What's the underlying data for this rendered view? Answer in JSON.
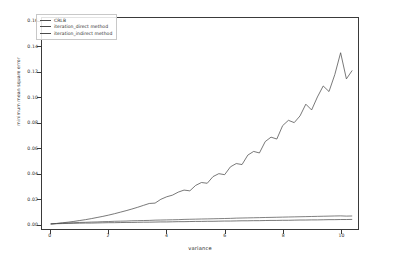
{
  "chart_data": {
    "type": "line",
    "title": "",
    "xlabel": "variance",
    "ylabel": "minimum mean square error",
    "xlim": [
      -0.3,
      10.6
    ],
    "ylim": [
      -0.004,
      0.163
    ],
    "grid": false,
    "legend_position": "upper left",
    "xticks": [
      "0",
      "2",
      "4",
      "6",
      "8",
      "10"
    ],
    "xtick_values": [
      0,
      2,
      4,
      6,
      8,
      10
    ],
    "yticks": [
      "0.00",
      "0.02",
      "0.04",
      "0.06",
      "0.08",
      "0.10",
      "0.12",
      "0.14",
      "0.16"
    ],
    "ytick_values": [
      0.0,
      0.02,
      0.04,
      0.06,
      0.08,
      0.1,
      0.12,
      0.14,
      0.16
    ],
    "series": [
      {
        "name": "CRLB",
        "color": "#4a4a4a",
        "x": [
          0.0,
          0.2,
          0.4,
          0.6,
          0.8,
          1.0,
          1.2,
          1.4,
          1.6,
          1.8,
          2.0,
          2.2,
          2.4,
          2.6,
          2.8,
          3.0,
          3.2,
          3.4,
          3.6,
          3.8,
          4.0,
          4.2,
          4.4,
          4.6,
          4.8,
          5.0,
          5.2,
          5.4,
          5.6,
          5.8,
          6.0,
          6.2,
          6.4,
          6.6,
          6.8,
          7.0,
          7.2,
          7.4,
          7.6,
          7.8,
          8.0,
          8.2,
          8.4,
          8.6,
          8.8,
          9.0,
          9.2,
          9.4,
          9.6,
          9.8,
          10.0,
          10.2,
          10.4
        ],
        "values": [
          0.0,
          0.0002,
          0.0003,
          0.0004,
          0.0005,
          0.0006,
          0.0007,
          0.0007,
          0.0008,
          0.0009,
          0.001,
          0.001,
          0.0011,
          0.0012,
          0.0012,
          0.0013,
          0.0014,
          0.0014,
          0.0015,
          0.0016,
          0.0016,
          0.0017,
          0.0018,
          0.0018,
          0.0019,
          0.002,
          0.002,
          0.0021,
          0.0021,
          0.0022,
          0.0023,
          0.0023,
          0.0024,
          0.0025,
          0.0025,
          0.0026,
          0.0026,
          0.0027,
          0.0028,
          0.0028,
          0.0029,
          0.0029,
          0.003,
          0.0031,
          0.0031,
          0.0032,
          0.0032,
          0.0033,
          0.0034,
          0.0034,
          0.0035,
          0.0035,
          0.0036
        ]
      },
      {
        "name": "iteration_direct method",
        "color": "#555555",
        "x": [
          0.0,
          0.2,
          0.4,
          0.6,
          0.8,
          1.0,
          1.2,
          1.4,
          1.6,
          1.8,
          2.0,
          2.2,
          2.4,
          2.6,
          2.8,
          3.0,
          3.2,
          3.4,
          3.6,
          3.8,
          4.0,
          4.2,
          4.4,
          4.6,
          4.8,
          5.0,
          5.2,
          5.4,
          5.6,
          5.8,
          6.0,
          6.2,
          6.4,
          6.6,
          6.8,
          7.0,
          7.2,
          7.4,
          7.6,
          7.8,
          8.0,
          8.2,
          8.4,
          8.6,
          8.8,
          9.0,
          9.2,
          9.4,
          9.6,
          9.8,
          10.0,
          10.2,
          10.4
        ],
        "values": [
          0.0,
          0.0003,
          0.0006,
          0.0008,
          0.001,
          0.0012,
          0.0013,
          0.0015,
          0.0016,
          0.0018,
          0.0019,
          0.0021,
          0.0022,
          0.0023,
          0.0025,
          0.0026,
          0.0027,
          0.0028,
          0.003,
          0.0031,
          0.0032,
          0.0033,
          0.0034,
          0.0036,
          0.0037,
          0.0038,
          0.0039,
          0.004,
          0.0041,
          0.0042,
          0.0043,
          0.0044,
          0.0046,
          0.0047,
          0.0048,
          0.0049,
          0.005,
          0.0051,
          0.0052,
          0.0053,
          0.0054,
          0.0055,
          0.0056,
          0.0057,
          0.0058,
          0.0059,
          0.006,
          0.0061,
          0.0062,
          0.0063,
          0.0064,
          0.0062,
          0.0063
        ]
      },
      {
        "name": "iteration_indirect method",
        "color": "#4a4a4a",
        "x": [
          0.0,
          0.2,
          0.4,
          0.6,
          0.8,
          1.0,
          1.2,
          1.4,
          1.6,
          1.8,
          2.0,
          2.2,
          2.4,
          2.6,
          2.8,
          3.0,
          3.2,
          3.4,
          3.6,
          3.8,
          4.0,
          4.2,
          4.4,
          4.6,
          4.8,
          5.0,
          5.2,
          5.4,
          5.6,
          5.8,
          6.0,
          6.2,
          6.4,
          6.6,
          6.8,
          7.0,
          7.2,
          7.4,
          7.6,
          7.8,
          8.0,
          8.2,
          8.4,
          8.6,
          8.8,
          9.0,
          9.2,
          9.4,
          9.6,
          9.8,
          10.0,
          10.2,
          10.4
        ],
        "values": [
          0.0,
          0.0004,
          0.0009,
          0.0014,
          0.002,
          0.0027,
          0.0034,
          0.0042,
          0.0051,
          0.006,
          0.007,
          0.0081,
          0.0093,
          0.0105,
          0.0118,
          0.0132,
          0.0147,
          0.0162,
          0.0165,
          0.0195,
          0.0215,
          0.0228,
          0.0252,
          0.0268,
          0.0262,
          0.0305,
          0.0328,
          0.0322,
          0.0375,
          0.0398,
          0.039,
          0.0452,
          0.0478,
          0.047,
          0.0545,
          0.0574,
          0.0562,
          0.0652,
          0.0687,
          0.0672,
          0.0778,
          0.082,
          0.0802,
          0.0855,
          0.0948,
          0.0902,
          0.1005,
          0.1092,
          0.1048,
          0.1182,
          0.1355,
          0.1148,
          0.1215
        ]
      }
    ]
  }
}
